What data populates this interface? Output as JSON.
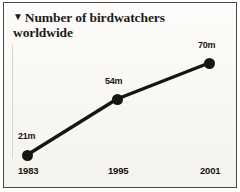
{
  "figure": {
    "title_marker": "▼",
    "title": "Number of birdwatchers worldwide",
    "frame_color": "#4a4a48",
    "paper_color": "#fbfaf7",
    "ink_color": "#16150f"
  },
  "chart_data": {
    "type": "line",
    "title": "Number of birdwatchers worldwide",
    "xlabel": "",
    "ylabel": "",
    "categories": [
      "1983",
      "1995",
      "2001"
    ],
    "values": [
      21,
      54,
      70
    ],
    "value_labels": [
      "21m",
      "54m",
      "70m"
    ],
    "unit": "millions",
    "grid": false,
    "legend": "none",
    "ylim": [
      0,
      80
    ],
    "series": [
      {
        "name": "Birdwatchers worldwide",
        "values": [
          21,
          54,
          70
        ]
      }
    ],
    "points": [
      {
        "x_label": "1983",
        "value": 21,
        "label": "21m",
        "px": 23,
        "py": 152,
        "label_x": 14,
        "label_y": 128
      },
      {
        "x_label": "1995",
        "value": 54,
        "label": "54m",
        "px": 113,
        "py": 96,
        "label_x": 101,
        "label_y": 73
      },
      {
        "x_label": "2001",
        "value": 70,
        "label": "70m",
        "px": 205,
        "py": 60,
        "label_x": 194,
        "label_y": 37
      }
    ],
    "x_tick_positions": [
      14,
      104,
      196
    ]
  }
}
